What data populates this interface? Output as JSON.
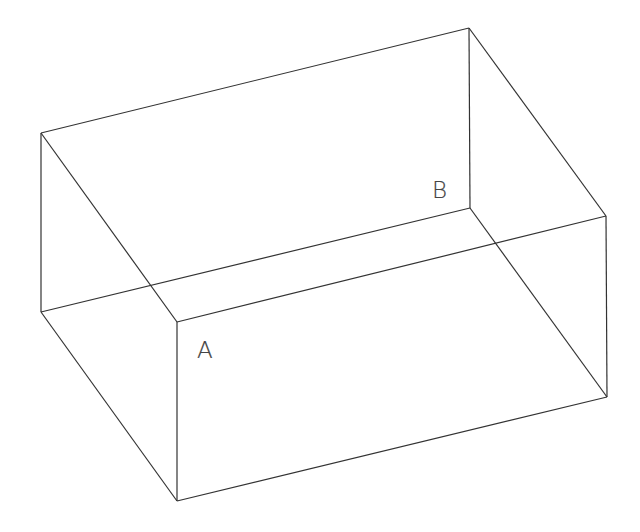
{
  "diagram": {
    "type": "wireframe-cuboid",
    "line_color": "#333333",
    "background": "#ffffff",
    "vertices": {
      "top_left_back": [
        41,
        133
      ],
      "top_right_back": [
        469,
        28
      ],
      "B": [
        470,
        208
      ],
      "left_bottom": [
        41,
        312
      ],
      "A": [
        177,
        322
      ],
      "right": [
        606,
        216
      ],
      "bottom_front": [
        177,
        501
      ],
      "bottom_right": [
        607,
        397
      ]
    },
    "edges": [
      [
        "top_left_back",
        "top_right_back"
      ],
      [
        "top_right_back",
        "B"
      ],
      [
        "top_left_back",
        "left_bottom"
      ],
      [
        "left_bottom",
        "B"
      ],
      [
        "top_left_back",
        "A"
      ],
      [
        "top_right_back",
        "right"
      ],
      [
        "A",
        "right"
      ],
      [
        "left_bottom",
        "bottom_front"
      ],
      [
        "A",
        "bottom_front"
      ],
      [
        "right",
        "bottom_right"
      ],
      [
        "bottom_front",
        "bottom_right"
      ],
      [
        "B",
        "bottom_right"
      ]
    ],
    "labels": [
      {
        "text": "A",
        "x": 197,
        "y": 339
      },
      {
        "text": "B",
        "x": 432,
        "y": 179
      }
    ]
  }
}
